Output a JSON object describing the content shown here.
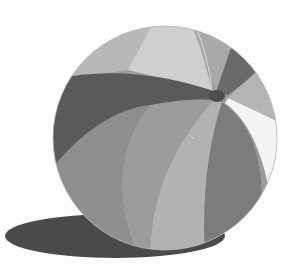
{
  "illustration": {
    "subject": "beach-ball",
    "background": "#fdfdfd",
    "shadow": {
      "color": "#4a4a4a"
    },
    "ball": {
      "outline": "#bdbdbd",
      "panels": {
        "top_light": "#cfcfcf",
        "top_left": "#b8b8b8",
        "top_right_light": "#a9a9a9",
        "dark_band": "#5a5a5a",
        "dark_right_top": "#6a6a6a",
        "right_light": "#b4b4b4",
        "white_strip": "#f4f4f4",
        "mid_gray": "#9c9c9c",
        "lower_left": "#8e8e8e",
        "center_light": "#b2b2b2",
        "right_dark": "#7c7c7c",
        "cap": "#4d4d4d"
      }
    }
  }
}
